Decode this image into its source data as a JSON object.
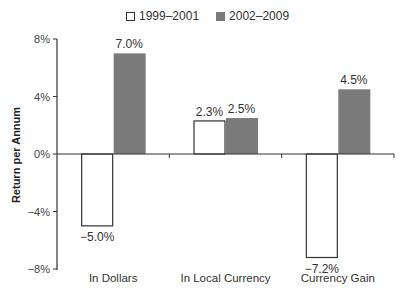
{
  "chart_data": {
    "type": "bar",
    "title": "",
    "xlabel": "",
    "ylabel": "Return per Annum",
    "ylim": [
      -8,
      8
    ],
    "yticks": [
      8,
      4,
      0,
      -4,
      -8
    ],
    "ytick_labels": [
      "8%",
      "4%",
      "0%",
      "−4%",
      "−8%"
    ],
    "grid": false,
    "legend_position": "top",
    "categories": [
      "In Dollars",
      "In Local Currency",
      "Currency Gain"
    ],
    "series": [
      {
        "name": "1999–2001",
        "values": [
          -5.0,
          2.3,
          -7.2
        ],
        "labels": [
          "−5.0%",
          "2.3%",
          "−7.2%"
        ],
        "color": "#ffffff",
        "stroke": "#333333"
      },
      {
        "name": "2002–2009",
        "values": [
          7.0,
          2.5,
          4.5
        ],
        "labels": [
          "7.0%",
          "2.5%",
          "4.5%"
        ],
        "color": "#7a7a7a",
        "stroke": "none"
      }
    ]
  },
  "legend": {
    "items": [
      {
        "label": "1999–2001",
        "swatch": "white"
      },
      {
        "label": "2002–2009",
        "swatch": "gray"
      }
    ]
  },
  "axis": {
    "ylabel": "Return per Annum"
  }
}
